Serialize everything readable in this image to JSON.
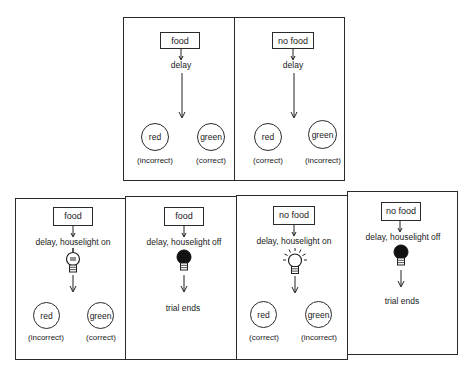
{
  "diagram": {
    "type": "experimental-trial-schematic",
    "top_row": [
      {
        "stimulus": "food",
        "step": "delay",
        "choices": [
          {
            "label": "red",
            "outcome": "(incorrect)"
          },
          {
            "label": "green",
            "outcome": "(correct)"
          }
        ]
      },
      {
        "stimulus": "no food",
        "step": "delay",
        "choices": [
          {
            "label": "red",
            "outcome": "(correct)"
          },
          {
            "label": "green",
            "outcome": "(incorrect)"
          }
        ]
      }
    ],
    "bottom_row": [
      {
        "stimulus": "food",
        "step": "delay, houselight on",
        "bulb": "on-unlit",
        "choices": [
          {
            "label": "red",
            "outcome": "(incorrect)"
          },
          {
            "label": "green",
            "outcome": "(correct)"
          }
        ]
      },
      {
        "stimulus": "food",
        "step": "delay, houselight off",
        "bulb": "off",
        "end": "trial ends"
      },
      {
        "stimulus": "no food",
        "step": "delay, houselight on",
        "bulb": "on-radiating",
        "choices": [
          {
            "label": "red",
            "outcome": "(correct)"
          },
          {
            "label": "green",
            "outcome": "(incorrect)"
          }
        ]
      },
      {
        "stimulus": "no food",
        "step": "delay, houselight off",
        "bulb": "off",
        "end": "trial ends"
      }
    ]
  }
}
